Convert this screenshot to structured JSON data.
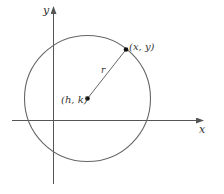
{
  "diagram": {
    "colors": {
      "background": "#ffffff",
      "axis": "#555555",
      "circle": "#666666",
      "radius": "#666666",
      "point": "#111111",
      "text": "#333333"
    },
    "axes": {
      "x_label": "x",
      "y_label": "y"
    },
    "circle": {
      "center_label": "(h, k)",
      "point_label": "(x, y)",
      "radius_label": "r"
    }
  }
}
